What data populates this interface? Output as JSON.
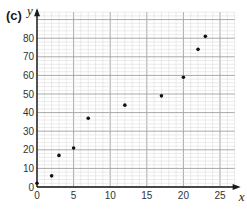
{
  "panel_label": "(c)",
  "chart_data": {
    "type": "scatter",
    "title": "",
    "xlabel": "x",
    "ylabel": "y",
    "xlim": [
      0,
      27
    ],
    "ylim": [
      0,
      94
    ],
    "grid": true,
    "x_ticks": [
      0,
      5,
      10,
      15,
      20,
      25
    ],
    "y_ticks": [
      0,
      10,
      20,
      30,
      40,
      50,
      60,
      70,
      80
    ],
    "x_tick_labels": [
      "0",
      "5",
      "10",
      "15",
      "20",
      "25"
    ],
    "y_tick_labels": [
      "0",
      "10",
      "20",
      "30",
      "40",
      "50",
      "60",
      "70",
      "80"
    ],
    "points": [
      {
        "x": 0,
        "y": 2
      },
      {
        "x": 2,
        "y": 6
      },
      {
        "x": 3,
        "y": 17
      },
      {
        "x": 5,
        "y": 21
      },
      {
        "x": 7,
        "y": 37
      },
      {
        "x": 12,
        "y": 44
      },
      {
        "x": 17,
        "y": 49
      },
      {
        "x": 20,
        "y": 59
      },
      {
        "x": 22,
        "y": 74
      },
      {
        "x": 23,
        "y": 81
      }
    ],
    "colors": {
      "grid_minor": "#d6d6d6",
      "grid_major": "#a8a8a8",
      "axis": "#1a1a1a",
      "point": "#111111"
    }
  }
}
